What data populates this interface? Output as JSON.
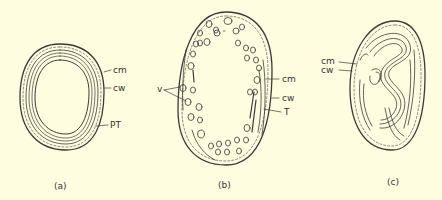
{
  "figure": {
    "background": "#fffde0",
    "ink": "#3a3a3a",
    "panels": [
      {
        "id": "a",
        "caption": "(a)",
        "labels": [
          {
            "text": "cm",
            "meaning": "cell membrane"
          },
          {
            "text": "cw",
            "meaning": "cell wall"
          },
          {
            "text": "PT",
            "meaning": "peripheral thylakoids"
          }
        ]
      },
      {
        "id": "b",
        "caption": "(b)",
        "labels": [
          {
            "text": "v",
            "meaning": "vesicles"
          },
          {
            "text": "cm",
            "meaning": "cell membrane"
          },
          {
            "text": "cw",
            "meaning": "cell wall"
          },
          {
            "text": "T",
            "meaning": "thylakoid"
          }
        ]
      },
      {
        "id": "c",
        "caption": "(c)",
        "labels": [
          {
            "text": "cm",
            "meaning": "cell membrane"
          },
          {
            "text": "cw",
            "meaning": "cell wall"
          }
        ]
      }
    ]
  }
}
